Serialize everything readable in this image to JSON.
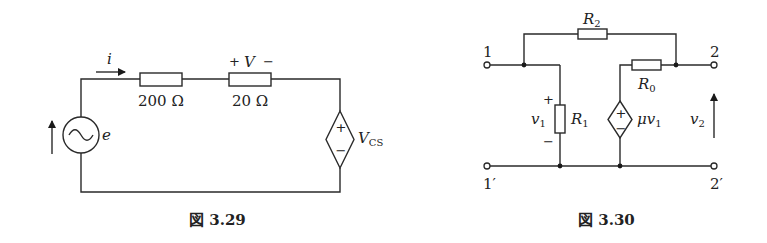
{
  "fig329": {
    "caption": "図 3.29",
    "current_label": "i",
    "source_label": "e",
    "r1_value": "200 Ω",
    "r2_value": "20 Ω",
    "v_plus": "+",
    "v_label": "V",
    "v_minus": "−",
    "dep_source_main": "V",
    "dep_source_sub": "CS",
    "dep_plus": "+",
    "dep_minus": "−"
  },
  "fig330": {
    "caption": "図 3.30",
    "terminal_1": "1",
    "terminal_1p": "1′",
    "terminal_2": "2",
    "terminal_2p": "2′",
    "r2_main": "R",
    "r2_sub": "2",
    "r1_main": "R",
    "r1_sub": "1",
    "r0_main": "R",
    "r0_sub": "0",
    "v1_main": "v",
    "v1_sub": "1",
    "v1_plus": "+",
    "v1_minus": "−",
    "dep_main": "μv",
    "dep_sub": "1",
    "dep_plus": "+",
    "dep_minus": "−",
    "v2_main": "v",
    "v2_sub": "2"
  }
}
